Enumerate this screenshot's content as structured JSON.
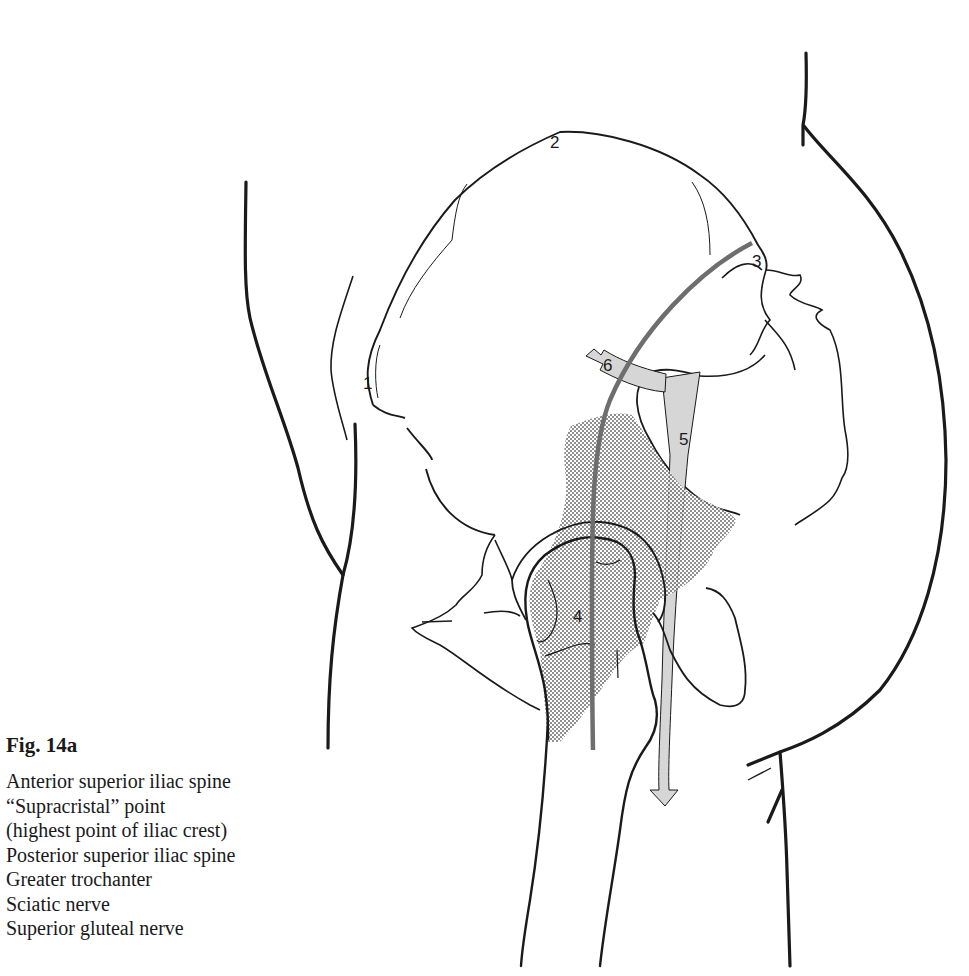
{
  "figure": {
    "title": "Fig. 14a",
    "numbers": {
      "n1": "1",
      "n2": "2",
      "n3": "3",
      "n4": "4",
      "n5": "5",
      "n6": "6"
    },
    "legend": [
      "Anterior superior iliac spine",
      "“Supracristal” point",
      "(highest point of iliac crest)",
      "Posterior superior iliac spine",
      "Greater trochanter",
      "Sciatic nerve",
      "Superior gluteal nerve"
    ],
    "colors": {
      "outline": "#1a1a1a",
      "nerve_fill": "#d6d6d6",
      "injection_line": "#6e6e6e",
      "stipple": "#3a3a3a"
    }
  }
}
